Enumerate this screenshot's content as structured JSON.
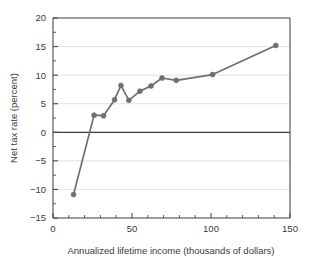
{
  "chart_data": {
    "type": "line",
    "title": "",
    "xlabel": "Annualized lifetime income (thousands of dollars)",
    "ylabel": "Net tax rate (percent)",
    "xlim": [
      0,
      150
    ],
    "ylim": [
      -15,
      20
    ],
    "xticks": [
      0,
      50,
      100,
      150
    ],
    "xtick_labels": [
      "0",
      "50",
      "100",
      "150"
    ],
    "xminor_step": 10,
    "yticks": [
      -15,
      -10,
      -5,
      0,
      5,
      10,
      15,
      20
    ],
    "ytick_labels": [
      "−15",
      "−10",
      "−5",
      "0",
      "5",
      "10",
      "15",
      "20"
    ],
    "yminor_step": 2.5,
    "grid": "horizontal-major",
    "zero_line": 0,
    "legend": "none",
    "series": [
      {
        "name": "Net tax rate",
        "color": "#6e6e78",
        "marker": "circle",
        "x": [
          13,
          26,
          32,
          39,
          43,
          48,
          55,
          62,
          69,
          78,
          101,
          141
        ],
        "values": [
          -10.9,
          3.0,
          2.9,
          5.7,
          8.2,
          5.6,
          7.2,
          8.1,
          9.5,
          9.1,
          10.1,
          15.2
        ]
      }
    ]
  },
  "axes": {
    "x_title": "Annualized lifetime income (thousands of dollars)",
    "y_title": "Net tax rate (percent)",
    "x_labels": [
      "0",
      "50",
      "100",
      "150"
    ],
    "y_labels": [
      "20",
      "15",
      "10",
      "5",
      "0",
      "−5",
      "−10",
      "−15"
    ]
  },
  "colors": {
    "series": "#6e6e78",
    "axis": "#4a4a4a",
    "grid": "#e3e3e6",
    "zero_line": "#3c3c3c",
    "text": "#3a3a3a",
    "background": "#ffffff"
  }
}
